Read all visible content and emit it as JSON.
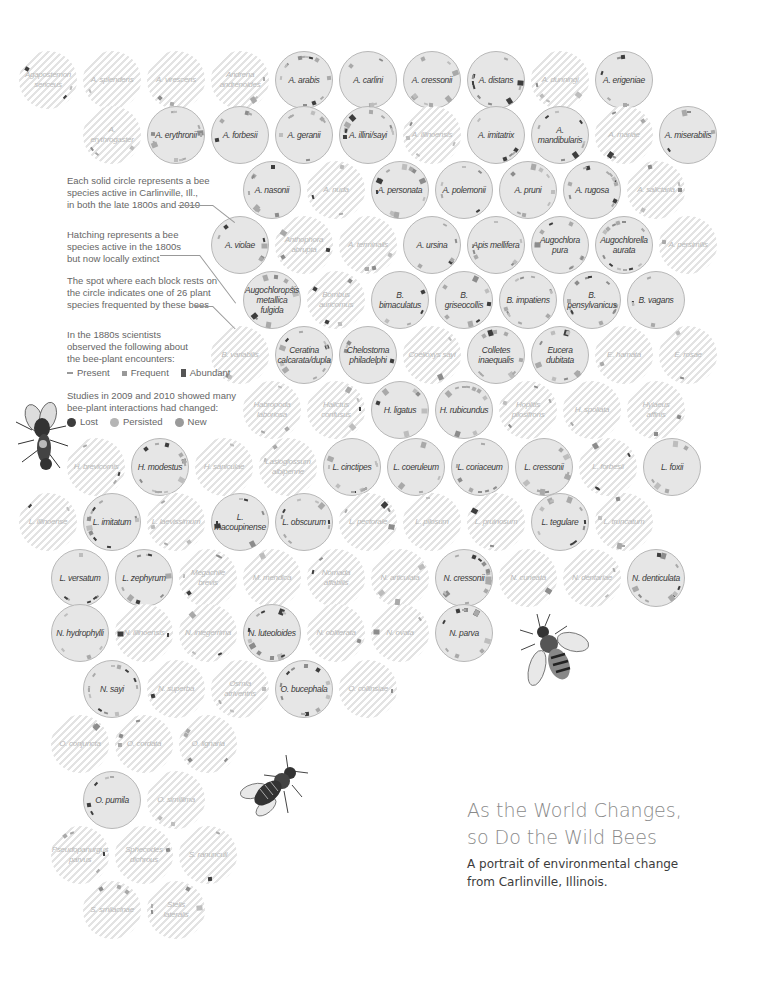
{
  "title": {
    "line1": "As the World Changes,",
    "line2": "so Do the Wild Bees",
    "subtitle_line1": "A portrait of environmental change",
    "subtitle_line2": "from Carlinville, Illinois."
  },
  "legend": {
    "solid_text": "Each solid circle represents a bee\nspecies active in Carlinville, Ill.,\nin both the late 1800s and 2010",
    "hatch_text": "Hatching represents a bee\nspecies active in the 1800s\nbut now locally extinct",
    "spot_text": "The spot where each block rests on\nthe circle indicates one of 26 plant\nspecies frequented by these bees",
    "observed_text": "In the 1880s scientists\nobserved the following about\nthe bee-plant encounters:",
    "observed_items": [
      {
        "label": "Present",
        "shape": "thin-dash"
      },
      {
        "label": "Frequent",
        "shape": "small-square"
      },
      {
        "label": "Abundant",
        "shape": "tall-block"
      }
    ],
    "studies_text": "Studies in 2009 and 2010 showed many\nbee-plant interactions had changed:",
    "status_items": [
      {
        "label": "Lost",
        "color": "#3d3d3d"
      },
      {
        "label": "Persisted",
        "color": "#a9a9a9"
      },
      {
        "label": "New",
        "color": "#8c8c8c"
      }
    ]
  },
  "colors": {
    "active_fill": "#e6e6e6",
    "active_stroke": "#b8b8b8",
    "hatch": "#e3e3e3",
    "lost": "#3d3d3d",
    "persisted": "#a9a9a9",
    "new": "#8c8c8c",
    "title": "#8a8a8a",
    "subtitle": "#3c3c3c"
  },
  "chart_data": {
    "type": "table",
    "title": "As the World Changes, so Do the Wild Bees",
    "subtitle": "A portrait of environmental change from Carlinville, Illinois.",
    "species": [
      {
        "name": "Agapostemon sericeus",
        "status": "extinct",
        "x": 48,
        "y": 80
      },
      {
        "name": "A. splendens",
        "status": "extinct",
        "x": 112,
        "y": 80
      },
      {
        "name": "A. virescens",
        "status": "extinct",
        "x": 176,
        "y": 80
      },
      {
        "name": "Andrena andrenoides",
        "status": "extinct",
        "x": 240,
        "y": 80
      },
      {
        "name": "A. arabis",
        "status": "active",
        "x": 304,
        "y": 80
      },
      {
        "name": "A. carlini",
        "status": "active",
        "x": 368,
        "y": 80
      },
      {
        "name": "A. cressonii",
        "status": "active",
        "x": 432,
        "y": 80
      },
      {
        "name": "A. distans",
        "status": "active",
        "x": 496,
        "y": 80
      },
      {
        "name": "A. dunningi",
        "status": "extinct",
        "x": 560,
        "y": 80
      },
      {
        "name": "A. erigeniae",
        "status": "active",
        "x": 624,
        "y": 80
      },
      {
        "name": "A. erythrogaster",
        "status": "extinct",
        "x": 112,
        "y": 135
      },
      {
        "name": "A. erythronii",
        "status": "active",
        "x": 176,
        "y": 135
      },
      {
        "name": "A. forbesii",
        "status": "active",
        "x": 240,
        "y": 135
      },
      {
        "name": "A. geranii",
        "status": "active",
        "x": 304,
        "y": 135
      },
      {
        "name": "A. illini/sayi",
        "status": "active",
        "x": 368,
        "y": 135
      },
      {
        "name": "A. illinoensis",
        "status": "extinct",
        "x": 432,
        "y": 135
      },
      {
        "name": "A. imitatrix",
        "status": "active",
        "x": 496,
        "y": 135
      },
      {
        "name": "A. mandibularis",
        "status": "active",
        "x": 560,
        "y": 135
      },
      {
        "name": "A. mariae",
        "status": "extinct",
        "x": 624,
        "y": 135
      },
      {
        "name": "A. miserabilis",
        "status": "active",
        "x": 688,
        "y": 135
      },
      {
        "name": "A. nasonii",
        "status": "active",
        "x": 272,
        "y": 190
      },
      {
        "name": "A. nuda",
        "status": "extinct",
        "x": 336,
        "y": 190
      },
      {
        "name": "A. personata",
        "status": "active",
        "x": 400,
        "y": 190
      },
      {
        "name": "A. polemonii",
        "status": "active",
        "x": 464,
        "y": 190
      },
      {
        "name": "A. pruni",
        "status": "active",
        "x": 528,
        "y": 190
      },
      {
        "name": "A. rugosa",
        "status": "active",
        "x": 592,
        "y": 190
      },
      {
        "name": "A. salictaria",
        "status": "extinct",
        "x": 656,
        "y": 190
      },
      {
        "name": "A. violae",
        "status": "active",
        "x": 240,
        "y": 245
      },
      {
        "name": "Anthophora abrupta",
        "status": "extinct",
        "x": 304,
        "y": 245
      },
      {
        "name": "A. terminalis",
        "status": "extinct",
        "x": 368,
        "y": 245
      },
      {
        "name": "A. ursina",
        "status": "active",
        "x": 432,
        "y": 245
      },
      {
        "name": "Apis mellifera",
        "status": "active",
        "x": 496,
        "y": 245
      },
      {
        "name": "Augochlora pura",
        "status": "active",
        "x": 560,
        "y": 245
      },
      {
        "name": "Augochlorella aurata",
        "status": "active",
        "x": 624,
        "y": 245
      },
      {
        "name": "A. persimilis",
        "status": "extinct",
        "x": 688,
        "y": 245
      },
      {
        "name": "Augochloropsis metallica fulgida",
        "status": "active",
        "x": 272,
        "y": 300
      },
      {
        "name": "Bombus auricomus",
        "status": "extinct",
        "x": 336,
        "y": 300
      },
      {
        "name": "B. bimaculatus",
        "status": "active",
        "x": 400,
        "y": 300
      },
      {
        "name": "B. griseocollis",
        "status": "active",
        "x": 464,
        "y": 300
      },
      {
        "name": "B. impatiens",
        "status": "active",
        "x": 528,
        "y": 300
      },
      {
        "name": "B. pensylvanicus",
        "status": "active",
        "x": 592,
        "y": 300
      },
      {
        "name": "B. vagans",
        "status": "active",
        "x": 656,
        "y": 300
      },
      {
        "name": "B. variabilis",
        "status": "extinct",
        "x": 240,
        "y": 355
      },
      {
        "name": "Ceratina calcarata/dupla",
        "status": "active",
        "x": 304,
        "y": 355
      },
      {
        "name": "Chelostoma philadelphi",
        "status": "active",
        "x": 368,
        "y": 355
      },
      {
        "name": "Coelioxys sayi",
        "status": "extinct",
        "x": 432,
        "y": 355
      },
      {
        "name": "Colletes inaequalis",
        "status": "active",
        "x": 496,
        "y": 355
      },
      {
        "name": "Eucera dubitata",
        "status": "active",
        "x": 560,
        "y": 355
      },
      {
        "name": "E. hamata",
        "status": "extinct",
        "x": 624,
        "y": 355
      },
      {
        "name": "E. rosae",
        "status": "extinct",
        "x": 688,
        "y": 355
      },
      {
        "name": "Habropoda laboriosa",
        "status": "extinct",
        "x": 272,
        "y": 410
      },
      {
        "name": "Halictus confusus",
        "status": "extinct",
        "x": 336,
        "y": 410
      },
      {
        "name": "H. ligatus",
        "status": "active",
        "x": 400,
        "y": 410
      },
      {
        "name": "H. rubicundus",
        "status": "active",
        "x": 464,
        "y": 410
      },
      {
        "name": "Hoplitis pilosifrons",
        "status": "extinct",
        "x": 528,
        "y": 410
      },
      {
        "name": "H. spoliata",
        "status": "extinct",
        "x": 592,
        "y": 410
      },
      {
        "name": "Hylaeus affinis",
        "status": "extinct",
        "x": 656,
        "y": 410
      },
      {
        "name": "H. brevicornis",
        "status": "extinct",
        "x": 96,
        "y": 467
      },
      {
        "name": "H. modestus",
        "status": "active",
        "x": 160,
        "y": 467
      },
      {
        "name": "H. saniculae",
        "status": "extinct",
        "x": 224,
        "y": 467
      },
      {
        "name": "Lasioglossum albipenne",
        "status": "extinct",
        "x": 288,
        "y": 467
      },
      {
        "name": "L. cinctipes",
        "status": "active",
        "x": 352,
        "y": 467
      },
      {
        "name": "L. coeruleum",
        "status": "active",
        "x": 416,
        "y": 467
      },
      {
        "name": "L. coriaceum",
        "status": "active",
        "x": 480,
        "y": 467
      },
      {
        "name": "L. cressonii",
        "status": "active",
        "x": 544,
        "y": 467
      },
      {
        "name": "L. forbesii",
        "status": "extinct",
        "x": 608,
        "y": 467
      },
      {
        "name": "L. foxii",
        "status": "active",
        "x": 672,
        "y": 467
      },
      {
        "name": "L. illinoense",
        "status": "extinct",
        "x": 48,
        "y": 522
      },
      {
        "name": "L. imitatum",
        "status": "active",
        "x": 112,
        "y": 522
      },
      {
        "name": "L. laevissimum",
        "status": "extinct",
        "x": 176,
        "y": 522
      },
      {
        "name": "L. macoupinense",
        "status": "active",
        "x": 240,
        "y": 522
      },
      {
        "name": "L. obscurum",
        "status": "active",
        "x": 304,
        "y": 522
      },
      {
        "name": "L. pectorale",
        "status": "extinct",
        "x": 368,
        "y": 522
      },
      {
        "name": "L. pilosum",
        "status": "extinct",
        "x": 432,
        "y": 522
      },
      {
        "name": "L. pruinosum",
        "status": "extinct",
        "x": 496,
        "y": 522
      },
      {
        "name": "L. tegulare",
        "status": "active",
        "x": 560,
        "y": 522
      },
      {
        "name": "L. truncatum",
        "status": "extinct",
        "x": 624,
        "y": 522
      },
      {
        "name": "L. versatum",
        "status": "active",
        "x": 80,
        "y": 578
      },
      {
        "name": "L. zephyrum",
        "status": "active",
        "x": 144,
        "y": 578
      },
      {
        "name": "Megachile brevis",
        "status": "extinct",
        "x": 208,
        "y": 578
      },
      {
        "name": "M. mendica",
        "status": "extinct",
        "x": 272,
        "y": 578
      },
      {
        "name": "Nomada affabilis",
        "status": "extinct",
        "x": 336,
        "y": 578
      },
      {
        "name": "N. articulata",
        "status": "extinct",
        "x": 400,
        "y": 578
      },
      {
        "name": "N. cressonii",
        "status": "active",
        "x": 464,
        "y": 578
      },
      {
        "name": "N. cuneata",
        "status": "extinct",
        "x": 528,
        "y": 578
      },
      {
        "name": "N. dentariae",
        "status": "extinct",
        "x": 592,
        "y": 578
      },
      {
        "name": "N. denticulata",
        "status": "active",
        "x": 656,
        "y": 578
      },
      {
        "name": "N. hydrophylli",
        "status": "active",
        "x": 80,
        "y": 633
      },
      {
        "name": "N. illinoensis",
        "status": "extinct",
        "x": 144,
        "y": 633
      },
      {
        "name": "N. integerrima",
        "status": "extinct",
        "x": 208,
        "y": 633
      },
      {
        "name": "N. luteoloides",
        "status": "active",
        "x": 272,
        "y": 633
      },
      {
        "name": "N. obliterata",
        "status": "extinct",
        "x": 336,
        "y": 633
      },
      {
        "name": "N. ovata",
        "status": "extinct",
        "x": 400,
        "y": 633
      },
      {
        "name": "N. parva",
        "status": "active",
        "x": 464,
        "y": 633
      },
      {
        "name": "N. sayi",
        "status": "active",
        "x": 112,
        "y": 689
      },
      {
        "name": "N. superba",
        "status": "extinct",
        "x": 176,
        "y": 689
      },
      {
        "name": "Osmia atriventris",
        "status": "extinct",
        "x": 240,
        "y": 689
      },
      {
        "name": "O. bucephala",
        "status": "active",
        "x": 304,
        "y": 689
      },
      {
        "name": "O. collinsiae",
        "status": "extinct",
        "x": 368,
        "y": 689
      },
      {
        "name": "O. conjuncta",
        "status": "extinct",
        "x": 80,
        "y": 744
      },
      {
        "name": "O. cordata",
        "status": "extinct",
        "x": 144,
        "y": 744
      },
      {
        "name": "O. lignaria",
        "status": "extinct",
        "x": 208,
        "y": 744
      },
      {
        "name": "O. pumila",
        "status": "active",
        "x": 112,
        "y": 800
      },
      {
        "name": "O. simillima",
        "status": "extinct",
        "x": 176,
        "y": 800
      },
      {
        "name": "Pseudopanurgus parvus",
        "status": "extinct",
        "x": 80,
        "y": 855
      },
      {
        "name": "Sphecodes dichrous",
        "status": "extinct",
        "x": 144,
        "y": 855
      },
      {
        "name": "S. ranunculi",
        "status": "extinct",
        "x": 208,
        "y": 855
      },
      {
        "name": "S. smilacinae",
        "status": "extinct",
        "x": 112,
        "y": 910
      },
      {
        "name": "Stelis lateralis",
        "status": "extinct",
        "x": 176,
        "y": 910
      }
    ],
    "legend": [
      "Present",
      "Frequent",
      "Abundant",
      "Lost",
      "Persisted",
      "New"
    ],
    "counts": {
      "total": 109,
      "plants": 26
    }
  }
}
